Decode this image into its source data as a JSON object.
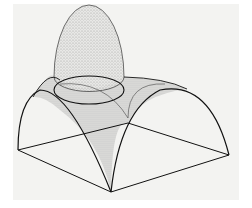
{
  "figure": {
    "subject": "Dome on pendentives",
    "background_color": "#f3f3f1",
    "line_color": "#1a1a1a",
    "shade_color": "#9a9a9a"
  }
}
